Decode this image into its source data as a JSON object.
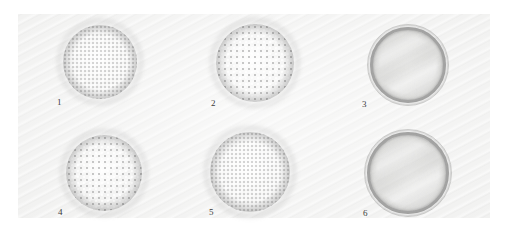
{
  "figure": {
    "kind": "photomicrograph-plate",
    "panel_background": "#f1f1f0",
    "page_background": "#ffffff",
    "caption_color": "#3a3a3a",
    "rows": 2,
    "columns": 3,
    "specimen_count": 6
  },
  "specimens": [
    {
      "label": "1",
      "texture": "granular",
      "cx": 100,
      "cy": 62,
      "r": 37,
      "label_x": 57,
      "label_y": 98
    },
    {
      "label": "2",
      "texture": "granular",
      "cx": 255,
      "cy": 63,
      "r": 39,
      "label_x": 211,
      "label_y": 99
    },
    {
      "label": "3",
      "texture": "walled",
      "cx": 408,
      "cy": 65,
      "r": 38,
      "label_x": 362,
      "label_y": 100
    },
    {
      "label": "4",
      "texture": "granular",
      "cx": 104,
      "cy": 173,
      "r": 38,
      "label_x": 58,
      "label_y": 208
    },
    {
      "label": "5",
      "texture": "granular",
      "cx": 250,
      "cy": 172,
      "r": 40,
      "label_x": 209,
      "label_y": 208
    },
    {
      "label": "6",
      "texture": "walled",
      "cx": 408,
      "cy": 173,
      "r": 41,
      "label_x": 363,
      "label_y": 209
    }
  ]
}
